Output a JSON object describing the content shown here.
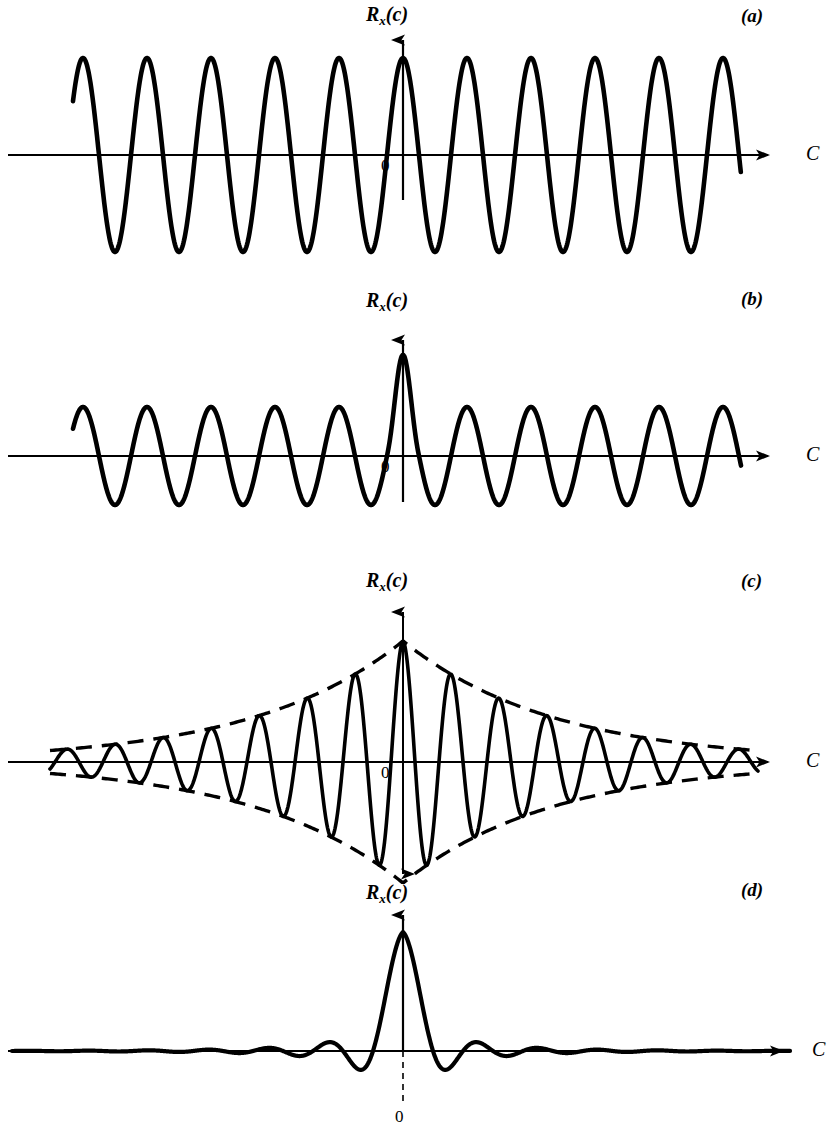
{
  "figure": {
    "title": "",
    "background": "#ffffff",
    "ink": "#000000",
    "width": 835,
    "height": 1143
  },
  "labels": {
    "y_axis_main": "R",
    "y_axis_sub": "x",
    "y_axis_arg": "(c)",
    "x_axis": "C",
    "origin": "0",
    "panel_a": "(a)",
    "panel_b": "(b)",
    "panel_c": "(c)",
    "panel_d": "(d)"
  },
  "chart_data": [
    {
      "id": "panel-a",
      "type": "line",
      "title": "(a)",
      "xlabel": "C",
      "ylabel": "Rx(c)",
      "description": "Undamped periodic autocorrelation: constant-amplitude cosine",
      "function": "A*cos(2*pi*x/T)",
      "amplitude": 1.0,
      "period_px": 64,
      "baseline_y": 155,
      "peak_y": 58,
      "trough_y": 232,
      "x_start": 73,
      "x_end": 741,
      "axis_x_left": 8,
      "axis_x_right": 776,
      "y_axis_x": 403,
      "y_axis_top": 30,
      "y_axis_bottom": 200,
      "envelope": false,
      "grid": false,
      "xlim": [
        8,
        776
      ],
      "ylim": [
        -1,
        1
      ],
      "n_visible_peaks": 11
    },
    {
      "id": "panel-b",
      "type": "line",
      "title": "(b)",
      "xlabel": "C",
      "ylabel": "Rx(c)",
      "description": "Periodic autocorrelation plus a white-noise delta spike at the origin",
      "function": "A*cos(2*pi*x/T) + spike at c=0",
      "amplitude": 0.62,
      "spike_amplitude": 1.0,
      "period_px": 64,
      "baseline_y": 456,
      "peak_y": 407,
      "trough_y": 505,
      "spike_peak_y": 355,
      "x_start": 73,
      "x_end": 741,
      "axis_x_left": 8,
      "axis_x_right": 776,
      "y_axis_x": 403,
      "y_axis_top": 330,
      "y_axis_bottom": 502,
      "envelope": false,
      "grid": false,
      "xlim": [
        8,
        776
      ],
      "ylim": [
        -1,
        1
      ],
      "n_visible_peaks": 11
    },
    {
      "id": "panel-c",
      "type": "line",
      "title": "(c)",
      "xlabel": "C",
      "ylabel": "Rx(c)",
      "description": "Exponentially damped cosine autocorrelation with dashed exponential envelopes",
      "function": "A*exp(-|x|/tau)*cos(2*pi*x/T)",
      "amplitude": 1.0,
      "period_px": 48,
      "decay_tau_px": 150,
      "baseline_y": 762,
      "peak_y": 641,
      "trough_y": 880,
      "x_start": 50,
      "x_end": 758,
      "axis_x_left": 8,
      "axis_x_right": 776,
      "y_axis_x": 403,
      "y_axis_top": 602,
      "y_axis_bottom": 884,
      "envelope": true,
      "envelope_style": "dashed",
      "grid": false,
      "xlim": [
        8,
        776
      ],
      "ylim": [
        -1,
        1
      ],
      "n_visible_peaks": 15
    },
    {
      "id": "panel-d",
      "type": "line",
      "title": "(d)",
      "xlabel": "C",
      "ylabel": "Rx(c)",
      "description": "Band-limited white noise autocorrelation: sinc-like narrow central peak with small decaying side lobes",
      "function": "A*sin(pi*x/W)/(pi*x/W)",
      "amplitude": 1.0,
      "lobe_half_width_px": 30,
      "baseline_y": 1051,
      "peak_y": 932,
      "x_start": 12,
      "x_end": 790,
      "axis_x_left": 8,
      "axis_x_right": 790,
      "y_axis_x": 403,
      "y_axis_top": 905,
      "y_axis_bottom": 1100,
      "origin_tick_dashed": true,
      "envelope": false,
      "grid": false,
      "xlim": [
        8,
        790
      ],
      "ylim": [
        -0.3,
        1
      ],
      "side_lobe_amplitudes": [
        0.2,
        0.12,
        0.07,
        0.04,
        0.02
      ]
    }
  ]
}
